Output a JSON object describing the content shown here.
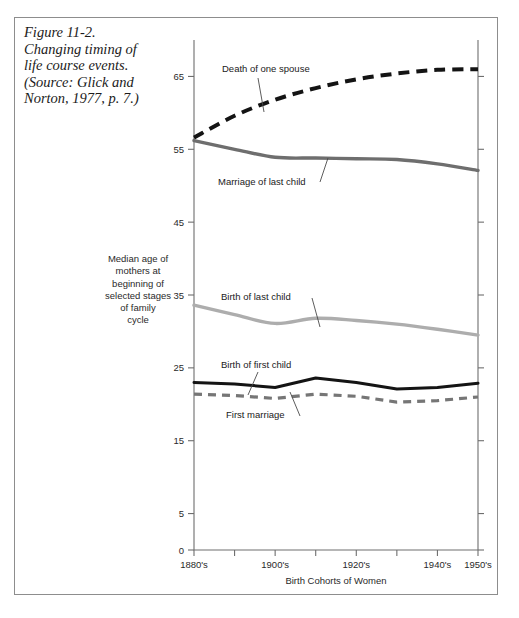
{
  "caption": {
    "lines": [
      "Figure 11-2.",
      "Changing timing of",
      "life course events.",
      "(Source: Glick and",
      "Norton, 1977, p. 7.)"
    ]
  },
  "axis": {
    "y_title_lines": [
      "Median age of",
      "mothers at",
      "beginning of",
      "selected stages",
      "of family",
      "cycle"
    ],
    "x_title": "Birth Cohorts of Women"
  },
  "chart_data": {
    "type": "line",
    "title": "Changing timing of life course events.",
    "xlabel": "Birth Cohorts of Women",
    "ylabel": "Median age of mothers at beginning of selected stages of family cycle",
    "categories": [
      "1880's",
      "1890's",
      "1900's",
      "1910's",
      "1920's",
      "1930's",
      "1940's",
      "1950's"
    ],
    "xticklabels": [
      "1880's",
      "1900's",
      "1920's",
      "1940's",
      "1950's"
    ],
    "yticks": [
      0,
      5,
      15,
      25,
      35,
      45,
      55,
      65
    ],
    "ylim": [
      0,
      70
    ],
    "grid": false,
    "legend": "inline-annotations",
    "series": [
      {
        "name": "Death of one spouse",
        "style": "dashed",
        "color": "#141414",
        "width": 4.0,
        "values": [
          56.6,
          59.6,
          61.8,
          63.4,
          64.6,
          65.4,
          65.9,
          66.0
        ]
      },
      {
        "name": "Marriage of last child",
        "style": "solid",
        "color": "#6e6e6e",
        "width": 3.4,
        "values": [
          56.2,
          55.0,
          53.9,
          53.8,
          53.7,
          53.6,
          53.0,
          52.1
        ]
      },
      {
        "name": "Birth of last child",
        "style": "solid",
        "color": "#adadad",
        "width": 3.4,
        "values": [
          33.6,
          32.3,
          31.1,
          31.8,
          31.5,
          31.0,
          30.3,
          29.5
        ]
      },
      {
        "name": "Birth of first child",
        "style": "solid",
        "color": "#141414",
        "width": 3.0,
        "values": [
          23.0,
          22.8,
          22.3,
          23.6,
          23.0,
          22.1,
          22.3,
          22.9
        ]
      },
      {
        "name": "First marriage",
        "style": "dashed",
        "color": "#767676",
        "width": 3.2,
        "values": [
          21.4,
          21.2,
          20.8,
          21.4,
          21.1,
          20.3,
          20.5,
          21.0
        ]
      }
    ],
    "annotations": [
      {
        "label": "Death of one spouse",
        "x": 222,
        "y": 72
      },
      {
        "label": "Marriage of last child",
        "x": 218,
        "y": 185
      },
      {
        "label": "Birth of last child",
        "x": 221,
        "y": 300
      },
      {
        "label": "Birth of first child",
        "x": 221,
        "y": 368
      },
      {
        "label": "First marriage",
        "x": 226,
        "y": 418
      }
    ]
  },
  "footer": {
    "smudge": ""
  }
}
